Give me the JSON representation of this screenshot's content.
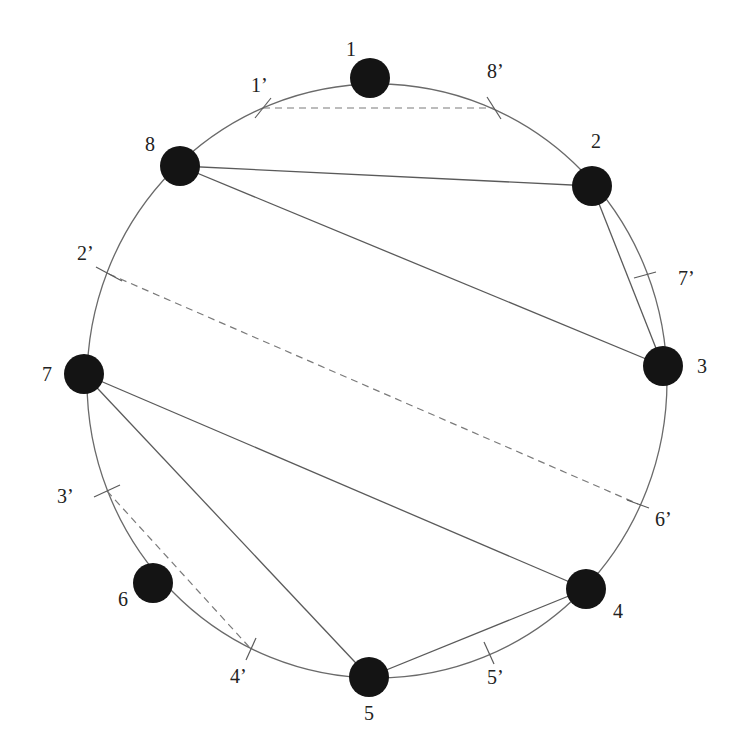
{
  "diagram": {
    "type": "circular-graph",
    "ring": {
      "cx": 377,
      "cy": 381,
      "rx": 290,
      "ry": 297
    },
    "colors": {
      "node": "#141414",
      "edge": "#5a5a5a",
      "ring": "#6a6a6a",
      "text": "#222222"
    },
    "nodes": [
      {
        "id": "1",
        "label": "1",
        "x": 370,
        "y": 78,
        "lx": 346,
        "ly": 56
      },
      {
        "id": "2",
        "label": "2",
        "x": 592,
        "y": 186,
        "lx": 591,
        "ly": 148
      },
      {
        "id": "3",
        "label": "3",
        "x": 663,
        "y": 366,
        "lx": 697,
        "ly": 373
      },
      {
        "id": "4",
        "label": "4",
        "x": 586,
        "y": 589,
        "lx": 613,
        "ly": 618
      },
      {
        "id": "5",
        "label": "5",
        "x": 369,
        "y": 677,
        "lx": 364,
        "ly": 720
      },
      {
        "id": "6",
        "label": "6",
        "x": 153,
        "y": 583,
        "lx": 118,
        "ly": 606
      },
      {
        "id": "7",
        "label": "7",
        "x": 84,
        "y": 374,
        "lx": 42,
        "ly": 381
      },
      {
        "id": "8",
        "label": "8",
        "x": 180,
        "y": 166,
        "lx": 145,
        "ly": 151
      }
    ],
    "cut_points": [
      {
        "id": "1p",
        "label": "1’",
        "x": 263,
        "y": 108,
        "tx": 8,
        "ty": -10,
        "lx": 251,
        "ly": 92
      },
      {
        "id": "8p",
        "label": "8’",
        "x": 494,
        "y": 108,
        "tx": -7,
        "ty": -11,
        "lx": 487,
        "ly": 78
      },
      {
        "id": "7p",
        "label": "7’",
        "x": 645,
        "y": 275,
        "tx": 11,
        "ty": -3,
        "lx": 678,
        "ly": 285
      },
      {
        "id": "6p",
        "label": "6’",
        "x": 638,
        "y": 504,
        "tx": 11,
        "ty": 4,
        "lx": 655,
        "ly": 526
      },
      {
        "id": "5p",
        "label": "5’",
        "x": 489,
        "y": 653,
        "tx": 5,
        "ty": 11,
        "lx": 487,
        "ly": 684
      },
      {
        "id": "4p",
        "label": "4’",
        "x": 251,
        "y": 649,
        "tx": -5,
        "ty": 11,
        "lx": 230,
        "ly": 683
      },
      {
        "id": "3p",
        "label": "3’",
        "x": 107,
        "y": 491,
        "tx": 13,
        "ty": -6,
        "lx": 57,
        "ly": 503
      },
      {
        "id": "2p",
        "label": "2’",
        "x": 109,
        "y": 274,
        "tx": 13,
        "ty": 7,
        "lx": 77,
        "ly": 260
      }
    ],
    "solid_edges": [
      [
        "8",
        "2"
      ],
      [
        "8",
        "3"
      ],
      [
        "2",
        "3"
      ],
      [
        "7",
        "4"
      ],
      [
        "7",
        "5"
      ],
      [
        "5",
        "4"
      ]
    ],
    "dashed_edges": [
      [
        "1p",
        "8p"
      ],
      [
        "2p",
        "6p"
      ],
      [
        "3p",
        "4p"
      ]
    ]
  }
}
